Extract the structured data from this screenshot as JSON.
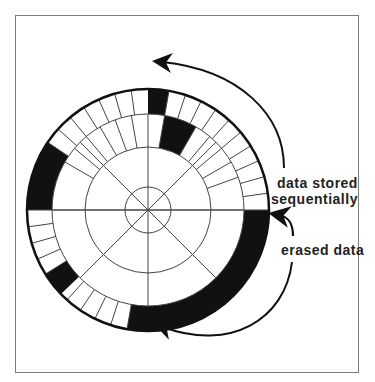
{
  "diagram": {
    "labels": {
      "stored_line1": "data stored",
      "stored_line2": "sequentially",
      "erased": "erased data"
    },
    "colors": {
      "background": "#ffffff",
      "frame": "#7a7a7a",
      "ink": "#111111",
      "grid": "#444444"
    },
    "geometry": {
      "center": [
        148,
        210
      ],
      "outer_radius": 121,
      "track1_inner_radius": 96,
      "track2_inner_radius": 63,
      "hub_radius": 23
    },
    "tracks": {
      "outer": {
        "filled_arcs_deg": [
          [
            0,
            10
          ],
          [
            90,
            190
          ],
          [
            226,
            238
          ],
          [
            270,
            304
          ]
        ],
        "dividers_deg": [
          10,
          18,
          26,
          34,
          42,
          50,
          58,
          66,
          74,
          82,
          190,
          198,
          206,
          214,
          222,
          238,
          246,
          254,
          262,
          304,
          312,
          320,
          328,
          336,
          344,
          352
        ]
      },
      "second": {
        "filled_arcs_deg": [
          [
            10,
            30
          ]
        ],
        "dividers_deg": [
          300,
          310,
          320,
          330,
          340,
          350,
          10,
          30,
          40,
          50,
          60,
          70
        ]
      }
    },
    "arrows": [
      {
        "name": "stored-direction-arrow",
        "meaning": "data stored sequentially (counter-clockwise)"
      },
      {
        "name": "erased-data-arrow",
        "meaning": "points to erased data start"
      },
      {
        "name": "erased-direction-arrow",
        "meaning": "erased region extent"
      }
    ]
  }
}
